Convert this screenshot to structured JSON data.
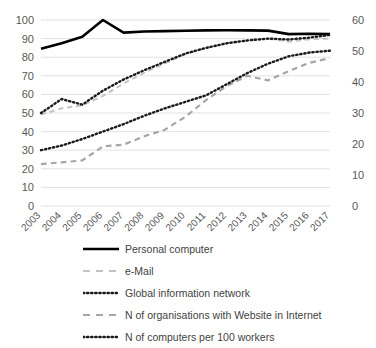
{
  "chart_data": {
    "type": "line",
    "title": "",
    "xlabel": "",
    "ylabel": "",
    "categories": [
      "2003",
      "2004",
      "2005",
      "2006",
      "2007",
      "2008",
      "2009",
      "2010",
      "2011",
      "2012",
      "2013",
      "2014",
      "2015",
      "2016",
      "2017"
    ],
    "grid": true,
    "legend_position": "bottom",
    "axes": {
      "left": {
        "ylim": [
          0,
          100
        ],
        "ticks": [
          0,
          10,
          20,
          30,
          40,
          50,
          60,
          70,
          80,
          90,
          100
        ],
        "tick_labels": [
          "0",
          "10",
          "20",
          "30",
          "40",
          "50",
          "60",
          "70",
          "80",
          "90",
          "100"
        ]
      },
      "right": {
        "ylim": [
          0,
          60
        ],
        "ticks": [
          0,
          10,
          20,
          30,
          40,
          50,
          60
        ],
        "tick_labels": [
          "0",
          "10",
          "20",
          "30",
          "40",
          "50",
          "60"
        ]
      }
    },
    "series": [
      {
        "name": "Personal computer",
        "axis": "left",
        "style": "solid",
        "color": "#000000",
        "width": 2.6,
        "values": [
          84.5,
          87.5,
          91.0,
          100.0,
          93.2,
          93.8,
          94.0,
          94.2,
          94.4,
          94.5,
          94.4,
          94.3,
          92.4,
          92.6,
          92.4
        ]
      },
      {
        "name": "e-Mail",
        "axis": "right",
        "style": "dashed",
        "color": "#c3c3c3",
        "width": 2.0,
        "values": [
          29.5,
          31.5,
          32.5,
          35.5,
          39.5,
          43.0,
          46.0,
          49.0,
          51.0,
          52.5,
          53.5,
          54.0,
          53.0,
          53.8,
          54.0
        ]
      },
      {
        "name": "Global information network",
        "axis": "left",
        "style": "dotted",
        "color": "#1a1a1a",
        "width": 2.4,
        "values": [
          50.0,
          57.5,
          54.5,
          62.0,
          68.0,
          73.0,
          77.5,
          82.0,
          85.0,
          87.5,
          89.0,
          90.0,
          89.5,
          90.5,
          92.0
        ]
      },
      {
        "name": "N of organisations with Website in Internet",
        "axis": "left",
        "style": "dashed",
        "color": "#a6a6a6",
        "width": 2.2,
        "values": [
          22.5,
          23.5,
          24.5,
          32.0,
          33.0,
          37.5,
          41.0,
          48.0,
          57.0,
          64.5,
          70.0,
          67.5,
          72.5,
          77.0,
          79.5
        ]
      },
      {
        "name": "N of computers per 100 workers",
        "axis": "left",
        "style": "dotted",
        "color": "#1a1a1a",
        "width": 2.4,
        "values": [
          30.0,
          32.5,
          36.0,
          40.0,
          44.0,
          48.5,
          52.5,
          56.0,
          59.5,
          65.5,
          71.5,
          76.5,
          80.5,
          82.5,
          83.5
        ]
      }
    ]
  },
  "legend": {
    "items": [
      {
        "label": "Personal computer",
        "swatch": "solid-line-swatch"
      },
      {
        "label": "e-Mail",
        "swatch": "dashed-light-line-swatch"
      },
      {
        "label": "Global information network",
        "swatch": "dotted-line-swatch"
      },
      {
        "label": "N of organisations with Website in Internet",
        "swatch": "dashed-gray-line-swatch"
      },
      {
        "label": "N of computers per 100 workers",
        "swatch": "dotted-line-swatch"
      }
    ]
  }
}
